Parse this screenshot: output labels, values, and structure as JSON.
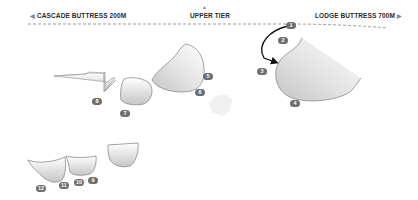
{
  "header": {
    "left_label": "CASCADE BUTTRESS 200M",
    "left_arrow": "◀",
    "center_label": "UPPER TIER",
    "center_arrow": "▲",
    "right_label": "LODGE BUTTRESS 700M",
    "right_arrow": "▶"
  },
  "markers": [
    {
      "id": "1",
      "x": 291,
      "y": 25
    },
    {
      "id": "2",
      "x": 283,
      "y": 40
    },
    {
      "id": "3",
      "x": 262,
      "y": 71
    },
    {
      "id": "4",
      "x": 295,
      "y": 103
    },
    {
      "id": "5",
      "x": 208,
      "y": 76
    },
    {
      "id": "6",
      "x": 200,
      "y": 92
    },
    {
      "id": "7",
      "x": 125,
      "y": 113
    },
    {
      "id": "8",
      "x": 97,
      "y": 101
    },
    {
      "id": "9",
      "x": 93,
      "y": 180
    },
    {
      "id": "10",
      "x": 79,
      "y": 182
    },
    {
      "id": "11",
      "x": 64,
      "y": 185
    },
    {
      "id": "12",
      "x": 41,
      "y": 188
    }
  ],
  "colors": {
    "rock_edge": "#8c8c8c",
    "rock_fill_light": "#f4f4f4",
    "rock_fill_dark": "#c8c8c8",
    "marker_bg": "#6e6e6e",
    "route_line": "#111111",
    "dash_line": "#9a9a9a"
  }
}
